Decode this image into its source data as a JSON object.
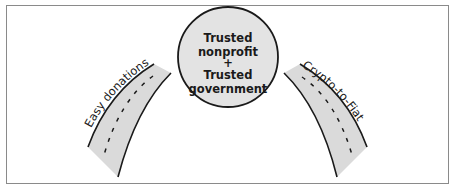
{
  "diagram": {
    "center_node": {
      "lines": [
        "Trusted",
        "nonprofit",
        "+",
        "Trusted",
        "government"
      ]
    },
    "left_road": {
      "label": "Easy donations"
    },
    "right_road": {
      "label": "Crypto-to-Fiat"
    },
    "colors": {
      "circle_fill": "#e3e3e3",
      "road_fill": "#dadada",
      "stroke": "#1a1a1a",
      "frame": "#8a8a8a"
    }
  }
}
